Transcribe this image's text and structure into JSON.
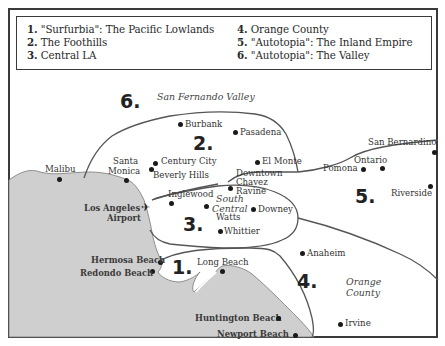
{
  "legend": {
    "items": [
      {
        "num": "1.",
        "text": "\"Surfurbia\": The Pacific Lowlands"
      },
      {
        "num": "2.",
        "text": "The Foothills"
      },
      {
        "num": "3.",
        "text": "Central LA"
      },
      {
        "num": "4.",
        "text": "Orange County"
      },
      {
        "num": "5.",
        "text": "\"Autotopia\": The Inland Empire"
      },
      {
        "num": "6.",
        "text": "\"Autotopia\": The Valley"
      }
    ]
  },
  "regions": {
    "r1": "1.",
    "r2": "2.",
    "r3": "3.",
    "r4": "4.",
    "r5": "5.",
    "r6": "6."
  },
  "areas": {
    "san_fernando": "San Fernando Valley",
    "south_central_1": "South",
    "south_central_2": "Central",
    "orange_1": "Orange",
    "orange_2": "County"
  },
  "places": {
    "burbank": "Burbank",
    "pasadena": "Pasadena",
    "malibu": "Malibu",
    "santa_monica_1": "Santa",
    "santa_monica_2": "Monica",
    "century_city": "Century City",
    "beverly_hills": "Beverly Hills",
    "el_monte": "El Monte",
    "downtown": "Downtown",
    "chavez_1": "Chavez",
    "chavez_2": "Ravine",
    "san_bernardino": "San Bernardino",
    "ontario": "Ontario",
    "pomona": "Pomona",
    "riverside": "Riverside",
    "inglewood": "Inglewood",
    "watts": "Watts",
    "downey": "Downey",
    "whittier": "Whittier",
    "lax_1": "Los Angeles",
    "lax_2": "Airport",
    "hermosa": "Hermosa Beach",
    "redondo": "Redondo Beach",
    "long_beach": "Long Beach",
    "anaheim": "Anaheim",
    "huntington": "Huntington Beach",
    "newport": "Newport Beach",
    "irvine": "Irvine"
  },
  "icons": {
    "airport": "✈"
  },
  "colors": {
    "ocean": "#cfcfcf",
    "land": "#ffffff",
    "boundary": "#555555"
  }
}
